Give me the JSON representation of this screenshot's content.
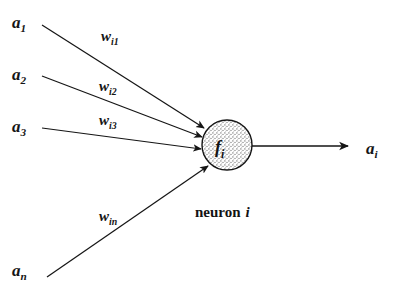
{
  "figure": {
    "background_color": "#ffffff",
    "ink_color": "#151515"
  },
  "inputs": [
    {
      "id": "a1",
      "base": "a",
      "sub": "1",
      "x": 12,
      "y": 14
    },
    {
      "id": "a2",
      "base": "a",
      "sub": "2",
      "x": 12,
      "y": 66
    },
    {
      "id": "a3",
      "base": "a",
      "sub": "3",
      "x": 12,
      "y": 118
    },
    {
      "id": "an",
      "base": "a",
      "sub": "n",
      "x": 12,
      "y": 262
    }
  ],
  "weights": [
    {
      "id": "wi1",
      "base": "w",
      "sub": "i1",
      "x": 101,
      "y": 29
    },
    {
      "id": "wi2",
      "base": "w",
      "sub": "i2",
      "x": 99,
      "y": 79
    },
    {
      "id": "wi3",
      "base": "w",
      "sub": "i3",
      "x": 99,
      "y": 113
    },
    {
      "id": "win",
      "base": "w",
      "sub": "in",
      "x": 99,
      "y": 209
    }
  ],
  "neuron": {
    "function_base": "f",
    "function_sub": "i",
    "caption_word": "neuron",
    "caption_index": "i",
    "fill_pattern": "stipple",
    "center_x": 227,
    "center_y": 145,
    "radius": 25
  },
  "output": {
    "id": "ai",
    "base": "a",
    "sub": "i",
    "x": 366,
    "y": 140
  },
  "connections": [
    {
      "from": "a1",
      "x1": 42,
      "y1": 25,
      "x2": 204,
      "y2": 128,
      "arrow": true
    },
    {
      "from": "a2",
      "x1": 42,
      "y1": 76,
      "x2": 202,
      "y2": 137,
      "arrow": true
    },
    {
      "from": "a3",
      "x1": 42,
      "y1": 128,
      "x2": 201,
      "y2": 149,
      "arrow": true
    },
    {
      "from": "an",
      "x1": 47,
      "y1": 277,
      "x2": 208,
      "y2": 166,
      "arrow": true
    },
    {
      "from": "neuron",
      "x1": 252,
      "y1": 146,
      "x2": 348,
      "y2": 146,
      "arrow": true
    }
  ]
}
